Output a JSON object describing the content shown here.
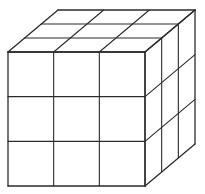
{
  "figure": {
    "title": "3x3x3 cube made of unit cubes",
    "grid_size": 3,
    "visible_faces": [
      "front",
      "top",
      "right"
    ],
    "line_color": "#2b2b2b",
    "background_color": "#ffffff"
  },
  "geometry": {
    "front_face": {
      "x0": 8,
      "y0": 52,
      "x1": 145,
      "y1": 186
    },
    "depth_offset": {
      "dx": 50,
      "dy": -42
    }
  }
}
